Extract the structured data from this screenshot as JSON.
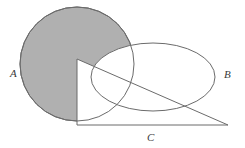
{
  "figure": {
    "type": "venn-diagram",
    "background_color": "#ffffff",
    "canvas": {
      "width": 245,
      "height": 148
    }
  },
  "labels": {
    "a": "A",
    "b": "B",
    "c": "C"
  },
  "shapes": {
    "circle": {
      "name": "A",
      "cx": 77,
      "cy": 64,
      "r": 57,
      "fill": "#b0b0b0",
      "stroke": "#6b6b6b",
      "stroke_width": 1,
      "shaded": "true"
    },
    "ellipse": {
      "name": "B",
      "cx": 153,
      "cy": 77,
      "rx": 62,
      "ry": 34,
      "fill": "none",
      "stroke": "#6b6b6b",
      "stroke_width": 1,
      "shaded": "false"
    },
    "triangle": {
      "name": "C",
      "points": "77,59 77,125 228,125",
      "apex_x": 77,
      "apex_y": 59,
      "corner_x": 77,
      "corner_y": 125,
      "right_x": 228,
      "right_y": 125,
      "fill": "#ffffff",
      "stroke": "#6b6b6b",
      "stroke_width": 1,
      "shaded": "false"
    }
  },
  "colors": {
    "shade_gray": "#b0b0b0",
    "outline_gray": "#6b6b6b",
    "label_gray": "#3a3a3a",
    "page_white": "#ffffff"
  }
}
